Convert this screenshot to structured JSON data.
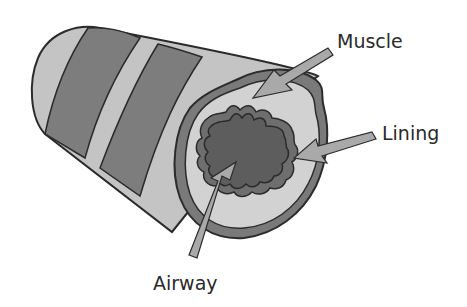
{
  "diagram": {
    "labels": {
      "muscle": "Muscle",
      "lining": "Lining",
      "airway": "Airway"
    },
    "colors": {
      "outline": "#2b2b2b",
      "tube_light": "#c4c4c4",
      "tube_dark": "#7d7d7d",
      "muscle_ring": "#7a7a7a",
      "cross_section_fill": "#d2d2d2",
      "lining": "#6e6e6e",
      "airway_lumen": "#5d5d5d",
      "arrow": "#a9a9a9",
      "label_text": "#2a2a2a"
    }
  }
}
